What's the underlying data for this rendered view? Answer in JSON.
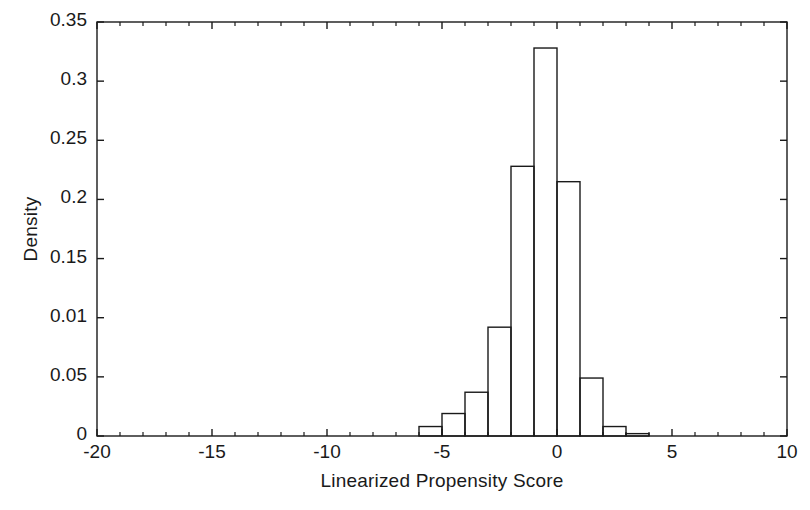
{
  "chart_data": {
    "type": "bar",
    "title": "",
    "subtitle": "",
    "xlabel": "Linearized Propensity Score",
    "ylabel": "Density",
    "xlim": [
      -20,
      10
    ],
    "ylim": [
      0,
      0.35
    ],
    "grid": false,
    "legend": null,
    "bin_width": 1,
    "xticks": [
      -20,
      -15,
      -10,
      -5,
      0,
      5,
      10
    ],
    "xtick_labels": [
      "-20",
      "-15",
      "-10",
      "-5",
      "0",
      "5",
      "10"
    ],
    "xtick_minor_step": 1,
    "yticks": [
      0,
      0.05,
      0.1,
      0.15,
      0.2,
      0.25,
      0.3,
      0.35
    ],
    "ytick_labels": [
      "0",
      "0.05",
      "0.01",
      "0.15",
      "0.2",
      "0.25",
      "0.3",
      "0.35"
    ],
    "bar_edge_color": "#1a1a1a",
    "bar_fill_color": "none",
    "axis_color": "#1a1a1a",
    "bins": [
      {
        "x0": -6,
        "x1": -5,
        "value": 0.008
      },
      {
        "x0": -5,
        "x1": -4,
        "value": 0.019
      },
      {
        "x0": -4,
        "x1": -3,
        "value": 0.037
      },
      {
        "x0": -3,
        "x1": -2,
        "value": 0.092
      },
      {
        "x0": -2,
        "x1": -1,
        "value": 0.228
      },
      {
        "x0": -1,
        "x1": 0,
        "value": 0.328
      },
      {
        "x0": 0,
        "x1": 1,
        "value": 0.215
      },
      {
        "x0": 1,
        "x1": 2,
        "value": 0.049
      },
      {
        "x0": 2,
        "x1": 3,
        "value": 0.008
      },
      {
        "x0": 3,
        "x1": 4,
        "value": 0.002
      }
    ],
    "categories": [
      "-6",
      "-5",
      "-4",
      "-3",
      "-2",
      "-1",
      "0",
      "1",
      "2",
      "3"
    ],
    "values": [
      0.008,
      0.019,
      0.037,
      0.092,
      0.228,
      0.328,
      0.215,
      0.049,
      0.008,
      0.002
    ]
  },
  "axes": {
    "ylabel": "Density",
    "xlabel": "Linearized Propensity Score"
  }
}
